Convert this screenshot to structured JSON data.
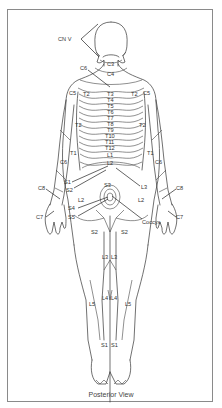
{
  "figure": {
    "view_caption": "Posterior View",
    "frame_color": "#8a8a8a",
    "line_color": "#333333",
    "head_labels": {
      "cranial": "CN V",
      "neck_upper": "C3",
      "neck_lower": "C4",
      "c6_pointer": "C6"
    },
    "shoulder_labels": {
      "left": "C5",
      "right": "C5"
    },
    "upper_back_labels": {
      "left_t2": "T2",
      "right_t2": "T2"
    },
    "arm_labels": {
      "left_t2": "T2",
      "right_t2": "T2",
      "left_t1": "T1",
      "right_t1": "T1",
      "left_c6": "C6",
      "right_c6": "C6"
    },
    "spine_labels": [
      "T3",
      "T4",
      "T5",
      "T6",
      "T7",
      "T8",
      "T9",
      "T10",
      "T11",
      "T12",
      "L1",
      "L2"
    ],
    "hand_labels": {
      "left_c8": "C8",
      "right_c8": "C8",
      "left_c7": "C7",
      "right_c7": "C7"
    },
    "pelvic_labels": {
      "s1": "S1",
      "s2_upper": "S2",
      "s3_center": "S3",
      "l3": "L3",
      "left_l2": "L2",
      "right_l2": "L2",
      "s4": "S4",
      "s5": "S5",
      "coccyx": "Coccyx"
    },
    "thigh_labels": {
      "left_s2": "S2",
      "right_s2": "S2",
      "left_l3": "L3",
      "right_l3": "L3"
    },
    "leg_labels": {
      "left_l5": "L5",
      "right_l5": "L5",
      "left_l4": "L4",
      "right_l4": "L4",
      "left_s1": "S1",
      "right_s1": "S1"
    }
  }
}
